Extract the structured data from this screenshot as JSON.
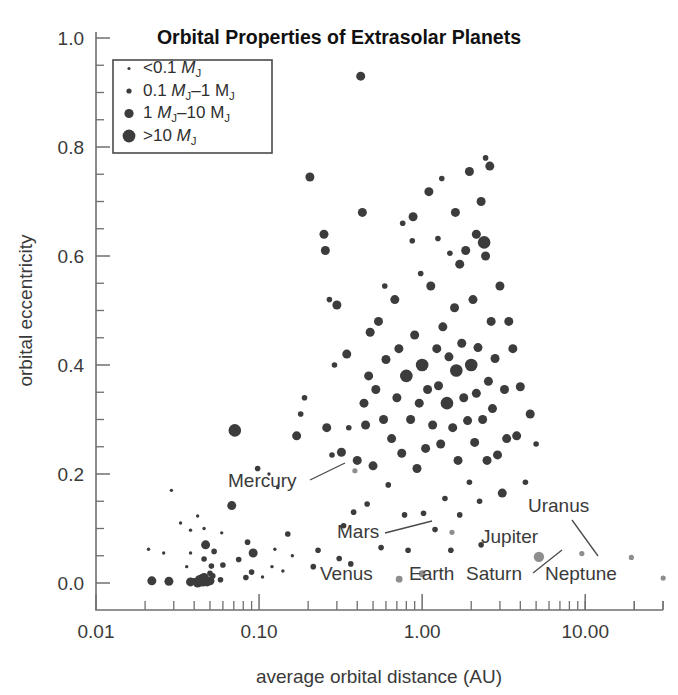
{
  "title": "Orbital Properties of Extrasolar Planets",
  "axes": {
    "xlabel": "average orbital distance (AU)",
    "ylabel": "orbital eccentricity",
    "x_ticklabels": [
      "0.01",
      "0.10",
      "1.00",
      "10.00"
    ],
    "y_ticklabels": [
      "0.0",
      "0.2",
      "0.4",
      "0.6",
      "0.8",
      "1.0"
    ]
  },
  "legend": {
    "title": "",
    "items": [
      {
        "label": "<0.1 ",
        "sym": "M",
        "sub": "J",
        "tail": "",
        "radius": 1.6
      },
      {
        "label": "0.1 ",
        "sym": "M",
        "sub": "J",
        "tail": "–1 M",
        "tail_sub": "J",
        "radius": 2.6
      },
      {
        "label": "1 ",
        "sym": "M",
        "sub": "J",
        "tail": "–10 M",
        "tail_sub": "J",
        "radius": 4.6
      },
      {
        "label": ">10 ",
        "sym": "M",
        "sub": "J",
        "tail": "",
        "radius": 6.4
      }
    ]
  },
  "annotations": [
    {
      "name": "Mercury",
      "text": "Mercury",
      "x": 228,
      "y": 487,
      "leader": [
        [
          310,
          480
        ],
        [
          345,
          463
        ]
      ]
    },
    {
      "name": "Mars",
      "text": "Mars",
      "x": 337,
      "y": 538,
      "leader": [
        [
          385,
          533
        ],
        [
          432,
          521
        ]
      ]
    },
    {
      "name": "Venus",
      "text": "Venus",
      "x": 320,
      "y": 580,
      "leader": null
    },
    {
      "name": "Earth",
      "text": "Earth",
      "x": 409,
      "y": 580,
      "leader": null
    },
    {
      "name": "Jupiter",
      "text": "Jupiter",
      "x": 481,
      "y": 543,
      "leader": null
    },
    {
      "name": "Saturn",
      "text": "Saturn",
      "x": 466,
      "y": 580,
      "leader": [
        [
          533,
          573
        ],
        [
          562,
          550
        ]
      ]
    },
    {
      "name": "Uranus",
      "text": "Uranus",
      "x": 528,
      "y": 512,
      "leader": [
        [
          572,
          520
        ],
        [
          598,
          556
        ]
      ]
    },
    {
      "name": "Neptune",
      "text": "Neptune",
      "x": 545,
      "y": 580,
      "leader": null
    }
  ],
  "chart_data": {
    "type": "scatter",
    "title": "Orbital Properties of Extrasolar Planets",
    "xlabel": "average orbital distance (AU)",
    "ylabel": "orbital eccentricity",
    "xscale": "log",
    "yscale": "linear",
    "xlim": [
      0.01,
      30.0
    ],
    "ylim": [
      0.0,
      1.0
    ],
    "grid": false,
    "legend_position": "top-left",
    "size_encoding": "marker area encodes planet mass in Jupiter masses",
    "size_classes": [
      {
        "label": "<0.1 MJ",
        "radius_px": 1.6
      },
      {
        "label": "0.1 MJ-1 MJ",
        "radius_px": 2.6
      },
      {
        "label": "1 MJ-10 MJ",
        "radius_px": 4.6
      },
      {
        "label": ">10 MJ",
        "radius_px": 6.4
      }
    ],
    "series": [
      {
        "name": "Extrasolar planets",
        "color": "#3c3c3c",
        "points": [
          [
            0.042,
            0.0,
            3
          ],
          [
            0.022,
            0.004,
            3
          ],
          [
            0.028,
            0.003,
            3
          ],
          [
            0.038,
            0.002,
            3
          ],
          [
            0.045,
            0.005,
            4
          ],
          [
            0.046,
            0.01,
            3
          ],
          [
            0.048,
            0.002,
            3
          ],
          [
            0.05,
            0.018,
            2
          ],
          [
            0.05,
            0.004,
            3
          ],
          [
            0.052,
            0.013,
            2
          ],
          [
            0.04,
            0.004,
            2
          ],
          [
            0.043,
            0.006,
            3
          ],
          [
            0.051,
            0.031,
            2
          ],
          [
            0.046,
            0.044,
            2
          ],
          [
            0.047,
            0.07,
            3
          ],
          [
            0.053,
            0.058,
            2
          ],
          [
            0.058,
            0.006,
            2
          ],
          [
            0.036,
            0.03,
            1
          ],
          [
            0.038,
            0.055,
            1
          ],
          [
            0.06,
            0.033,
            2
          ],
          [
            0.029,
            0.17,
            1
          ],
          [
            0.033,
            0.11,
            1
          ],
          [
            0.038,
            0.097,
            1
          ],
          [
            0.046,
            0.1,
            1
          ],
          [
            0.042,
            0.123,
            1
          ],
          [
            0.021,
            0.062,
            1
          ],
          [
            0.026,
            0.055,
            1
          ],
          [
            0.059,
            0.092,
            1
          ],
          [
            0.068,
            0.142,
            3
          ],
          [
            0.071,
            0.28,
            4
          ],
          [
            0.075,
            0.043,
            2
          ],
          [
            0.083,
            0.01,
            2
          ],
          [
            0.09,
            0.02,
            2
          ],
          [
            0.085,
            0.075,
            2
          ],
          [
            0.092,
            0.055,
            3
          ],
          [
            0.098,
            0.21,
            2
          ],
          [
            0.105,
            0.011,
            1
          ],
          [
            0.12,
            0.03,
            1
          ],
          [
            0.125,
            0.062,
            1
          ],
          [
            0.14,
            0.022,
            1
          ],
          [
            0.115,
            0.2,
            1
          ],
          [
            0.13,
            0.175,
            1
          ],
          [
            0.15,
            0.09,
            2
          ],
          [
            0.16,
            0.05,
            1
          ],
          [
            0.17,
            0.27,
            3
          ],
          [
            0.18,
            0.31,
            2
          ],
          [
            0.19,
            0.34,
            2
          ],
          [
            0.205,
            0.745,
            3
          ],
          [
            0.215,
            0.03,
            2
          ],
          [
            0.23,
            0.06,
            2
          ],
          [
            0.25,
            0.64,
            3
          ],
          [
            0.255,
            0.61,
            3
          ],
          [
            0.26,
            0.285,
            3
          ],
          [
            0.27,
            0.52,
            2
          ],
          [
            0.28,
            0.235,
            2
          ],
          [
            0.29,
            0.4,
            2
          ],
          [
            0.3,
            0.51,
            3
          ],
          [
            0.31,
            0.045,
            2
          ],
          [
            0.32,
            0.24,
            3
          ],
          [
            0.33,
            0.105,
            2
          ],
          [
            0.345,
            0.42,
            3
          ],
          [
            0.355,
            0.285,
            2
          ],
          [
            0.365,
            0.035,
            2
          ],
          [
            0.38,
            0.13,
            2
          ],
          [
            0.4,
            0.225,
            3
          ],
          [
            0.42,
            0.93,
            3
          ],
          [
            0.43,
            0.68,
            3
          ],
          [
            0.44,
            0.33,
            3
          ],
          [
            0.45,
            0.29,
            3
          ],
          [
            0.46,
            0.145,
            2
          ],
          [
            0.47,
            0.38,
            3
          ],
          [
            0.48,
            0.46,
            3
          ],
          [
            0.5,
            0.215,
            3
          ],
          [
            0.52,
            0.355,
            3
          ],
          [
            0.54,
            0.48,
            3
          ],
          [
            0.56,
            0.065,
            2
          ],
          [
            0.58,
            0.3,
            3
          ],
          [
            0.6,
            0.41,
            3
          ],
          [
            0.62,
            0.18,
            2
          ],
          [
            0.65,
            0.265,
            3
          ],
          [
            0.68,
            0.52,
            3
          ],
          [
            0.7,
            0.34,
            3
          ],
          [
            0.72,
            0.43,
            3
          ],
          [
            0.75,
            0.238,
            3
          ],
          [
            0.78,
            0.125,
            2
          ],
          [
            0.8,
            0.38,
            4
          ],
          [
            0.82,
            0.06,
            2
          ],
          [
            0.85,
            0.3,
            3
          ],
          [
            0.88,
            0.672,
            3
          ],
          [
            0.9,
            0.455,
            3
          ],
          [
            0.93,
            0.21,
            3
          ],
          [
            0.96,
            0.33,
            3
          ],
          [
            1.0,
            0.4,
            4
          ],
          [
            1.02,
            0.128,
            2
          ],
          [
            1.05,
            0.247,
            3
          ],
          [
            1.08,
            0.355,
            3
          ],
          [
            1.1,
            0.718,
            3
          ],
          [
            1.13,
            0.545,
            3
          ],
          [
            1.16,
            0.29,
            3
          ],
          [
            1.2,
            0.098,
            2
          ],
          [
            1.23,
            0.43,
            3
          ],
          [
            1.26,
            0.362,
            3
          ],
          [
            1.3,
            0.255,
            3
          ],
          [
            1.34,
            0.47,
            3
          ],
          [
            1.38,
            0.155,
            2
          ],
          [
            1.42,
            0.33,
            4
          ],
          [
            1.46,
            0.415,
            3
          ],
          [
            1.5,
            0.06,
            2
          ],
          [
            1.54,
            0.285,
            3
          ],
          [
            1.58,
            0.505,
            3
          ],
          [
            1.62,
            0.39,
            4
          ],
          [
            1.66,
            0.225,
            3
          ],
          [
            1.7,
            0.125,
            2
          ],
          [
            1.75,
            0.44,
            3
          ],
          [
            1.8,
            0.34,
            3
          ],
          [
            1.85,
            0.61,
            3
          ],
          [
            1.9,
            0.298,
            3
          ],
          [
            1.95,
            0.185,
            2
          ],
          [
            2.0,
            0.4,
            4
          ],
          [
            2.05,
            0.52,
            3
          ],
          [
            2.1,
            0.258,
            3
          ],
          [
            2.15,
            0.348,
            3
          ],
          [
            2.2,
            0.432,
            3
          ],
          [
            2.25,
            0.15,
            2
          ],
          [
            2.3,
            0.07,
            2
          ],
          [
            2.35,
            0.3,
            3
          ],
          [
            2.4,
            0.625,
            4
          ],
          [
            2.45,
            0.6,
            3
          ],
          [
            2.5,
            0.225,
            3
          ],
          [
            2.55,
            0.37,
            3
          ],
          [
            2.6,
            0.765,
            3
          ],
          [
            2.65,
            0.48,
            3
          ],
          [
            2.7,
            0.32,
            3
          ],
          [
            2.8,
            0.412,
            3
          ],
          [
            2.9,
            0.235,
            3
          ],
          [
            3.0,
            0.545,
            3
          ],
          [
            3.1,
            0.165,
            3
          ],
          [
            3.2,
            0.355,
            3
          ],
          [
            3.3,
            0.265,
            3
          ],
          [
            3.4,
            0.48,
            3
          ],
          [
            2.45,
            0.78,
            2
          ],
          [
            2.3,
            0.7,
            3
          ],
          [
            2.15,
            0.64,
            3
          ],
          [
            1.95,
            0.755,
            3
          ],
          [
            1.6,
            0.68,
            3
          ],
          [
            1.48,
            0.605,
            2
          ],
          [
            1.32,
            0.742,
            2
          ],
          [
            1.7,
            0.585,
            3
          ],
          [
            1.25,
            0.632,
            2
          ],
          [
            0.98,
            0.568,
            2
          ],
          [
            0.87,
            0.628,
            2
          ],
          [
            0.76,
            0.66,
            2
          ],
          [
            0.59,
            0.545,
            2
          ],
          [
            3.6,
            0.43,
            3
          ],
          [
            3.8,
            0.27,
            3
          ],
          [
            4.0,
            0.36,
            3
          ],
          [
            4.3,
            0.185,
            2
          ],
          [
            4.6,
            0.31,
            3
          ],
          [
            5.0,
            0.255,
            2
          ]
        ]
      },
      {
        "name": "Solar system planets",
        "color": "#8e8e8e",
        "points": [
          {
            "label": "Mercury",
            "x": 0.387,
            "y": 0.206
          },
          {
            "label": "Venus",
            "x": 0.723,
            "y": 0.007
          },
          {
            "label": "Earth",
            "x": 1.0,
            "y": 0.017
          },
          {
            "label": "Mars",
            "x": 1.524,
            "y": 0.093
          },
          {
            "label": "Jupiter",
            "x": 5.203,
            "y": 0.048
          },
          {
            "label": "Saturn",
            "x": 9.537,
            "y": 0.054
          },
          {
            "label": "Uranus",
            "x": 19.19,
            "y": 0.047
          },
          {
            "label": "Neptune",
            "x": 30.07,
            "y": 0.009
          }
        ]
      }
    ]
  }
}
